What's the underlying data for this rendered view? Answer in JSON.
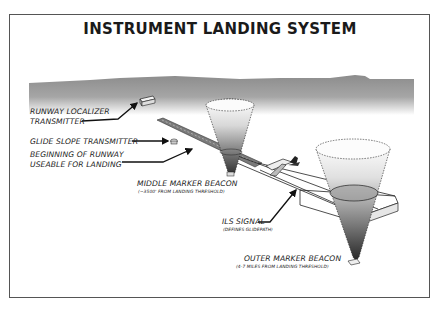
{
  "title": "INSTRUMENT LANDING SYSTEM",
  "labels": {
    "localizer_line1": "RUNWAY LOCALIZER",
    "localizer_line2": "TRANSMITTER",
    "glide_slope": "GLIDE SLOPE TRANSMITTER",
    "runway_begin_line1": "BEGINNING OF RUNWAY",
    "runway_begin_line2": "USEABLE FOR LANDING",
    "middle_marker": "MIDDLE MARKER BEACON",
    "middle_marker_note": "(~3500' FROM LANDING THRESHOLD)",
    "ils_signal": "ILS SIGNAL",
    "ils_signal_note": "(DEFINES GLIDEPATH)",
    "outer_marker": "OUTER MARKER BEACON",
    "outer_marker_note": "(4-7 MILES FROM LANDING THRESHOLD)"
  },
  "colors": {
    "frame": "#555555",
    "horizon": "#8a8a8a",
    "beam_dark": "#3a3a3a",
    "text": "#222222"
  }
}
